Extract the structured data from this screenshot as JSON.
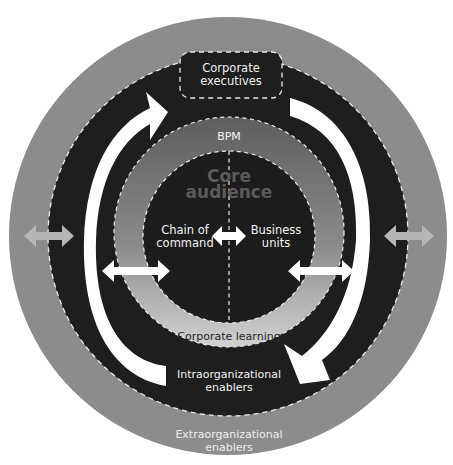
{
  "diagram": {
    "colors": {
      "outer_ring": "#8a8a8a",
      "dark_ring": "#1e1e1e",
      "bpm_ring_top": "#6e6e6e",
      "bpm_ring_bottom": "#c8c8c8",
      "core": "#1c1c1c",
      "core_text": "#5a5a5a",
      "arrow": "#ffffff",
      "outer_arrow": "#b8b8b8"
    },
    "layers": {
      "extraorganizational": {
        "line1": "Extraorganizational",
        "line2": "enablers"
      },
      "intraorganizational": {
        "line1": "Intraorganizational",
        "line2": "enablers"
      },
      "corporate_executives": {
        "line1": "Corporate",
        "line2": "executives"
      },
      "bpm": {
        "label": "BPM"
      },
      "corporate_learning": {
        "label": "Corporate learning"
      },
      "core_audience": {
        "line1": "Core",
        "line2": "audience"
      },
      "chain_of_command": {
        "line1": "Chain of",
        "line2": "command"
      },
      "business_units": {
        "line1": "Business",
        "line2": "units"
      }
    },
    "arrows": [
      {
        "name": "left-curved-arrow-up",
        "direction": "clockwise-up"
      },
      {
        "name": "right-curved-arrow-down",
        "direction": "clockwise-down"
      },
      {
        "name": "center-double-arrow",
        "direction": "horizontal"
      },
      {
        "name": "left-inner-double-arrow",
        "direction": "horizontal"
      },
      {
        "name": "right-inner-double-arrow",
        "direction": "horizontal"
      },
      {
        "name": "left-outer-double-arrow",
        "direction": "horizontal"
      },
      {
        "name": "right-outer-double-arrow",
        "direction": "horizontal"
      }
    ]
  }
}
